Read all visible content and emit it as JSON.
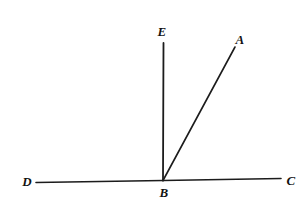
{
  "figure": {
    "kind": "geometry-diagram",
    "width": 308,
    "height": 219,
    "background_color": "#ffffff",
    "stroke_color": "#1c1c1c",
    "label_color": "#121212"
  },
  "points": [
    {
      "id": "E",
      "label": "E",
      "label_x": 162,
      "label_y": 31
    },
    {
      "id": "A",
      "label": "A",
      "label_x": 240,
      "label_y": 39
    },
    {
      "id": "D",
      "label": "D",
      "label_x": 27,
      "label_y": 181
    },
    {
      "id": "B",
      "label": "B",
      "label_x": 164,
      "label_y": 192
    },
    {
      "id": "C",
      "label": "C",
      "label_x": 291,
      "label_y": 180
    }
  ],
  "vertex": {
    "id": "B",
    "x": 163,
    "y": 180
  },
  "segments": [
    {
      "id": "BD",
      "from": "B",
      "to": "D",
      "x1": 163,
      "y1": 180.5,
      "x2": 36,
      "y2": 182.5,
      "width": 1.6
    },
    {
      "id": "BC",
      "from": "B",
      "to": "C",
      "x1": 163,
      "y1": 180.5,
      "x2": 281,
      "y2": 178.5,
      "width": 1.6
    },
    {
      "id": "BE",
      "from": "B",
      "to": "E",
      "x1": 163,
      "y1": 180.5,
      "x2": 163.5,
      "y2": 43,
      "width": 1.8
    },
    {
      "id": "BA",
      "from": "B",
      "to": "A",
      "x1": 163,
      "y1": 180.5,
      "x2": 235,
      "y2": 47,
      "width": 1.6
    }
  ]
}
